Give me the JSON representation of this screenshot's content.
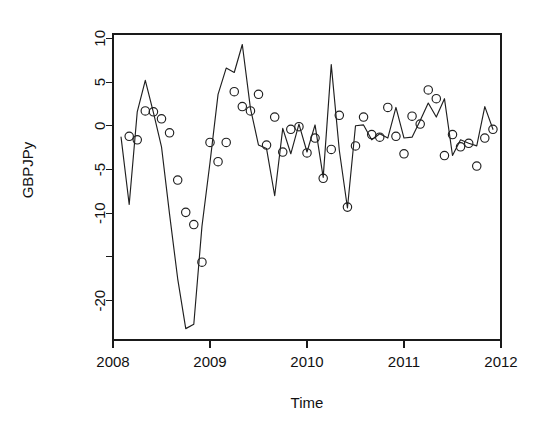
{
  "chart_data": {
    "type": "line",
    "title": "",
    "subtitle": "",
    "xlabel": "Time",
    "ylabel": "GBPJPy",
    "xlim": [
      2008.0,
      2012.0
    ],
    "ylim": [
      -24.5,
      10.5
    ],
    "grid": false,
    "legend": null,
    "x_ticks": [
      2008,
      2009,
      2010,
      2011,
      2012
    ],
    "x_tick_labels": [
      "2008",
      "2009",
      "2010",
      "2011",
      "2012"
    ],
    "y_ticks": [
      10,
      5,
      0,
      -5,
      -10,
      -15,
      -20
    ],
    "y_tick_labels": [
      "10",
      "5",
      "0",
      "-5",
      "-10",
      "",
      "-20"
    ],
    "series": [
      {
        "name": "fitted",
        "kind": "line",
        "marker": "none",
        "color": "#1f1f1f",
        "x": [
          2008.083,
          2008.167,
          2008.25,
          2008.333,
          2008.417,
          2008.5,
          2008.583,
          2008.667,
          2008.75,
          2008.833,
          2008.917,
          2009.0,
          2009.083,
          2009.167,
          2009.25,
          2009.333,
          2009.417,
          2009.5,
          2009.583,
          2009.667,
          2009.75,
          2009.833,
          2009.917,
          2010.0,
          2010.083,
          2010.167,
          2010.25,
          2010.333,
          2010.417,
          2010.5,
          2010.583,
          2010.667,
          2010.75,
          2010.833,
          2010.917,
          2011.0,
          2011.083,
          2011.167,
          2011.25,
          2011.333,
          2011.417,
          2011.5,
          2011.583,
          2011.667,
          2011.75,
          2011.833,
          2011.917
        ],
        "values": [
          -1.3,
          -9.0,
          1.6,
          5.2,
          1.5,
          -2.4,
          -10.1,
          -17.5,
          -23.2,
          -22.7,
          -11.5,
          -4.2,
          3.6,
          6.6,
          6.1,
          9.3,
          2.0,
          -2.2,
          -2.6,
          -8.0,
          -0.3,
          -3.2,
          0.2,
          -3.0,
          0.1,
          -5.9,
          7.0,
          -2.8,
          -9.4,
          0.0,
          0.1,
          -1.6,
          -0.9,
          -1.4,
          2.1,
          -1.4,
          -1.3,
          0.6,
          2.6,
          1.0,
          3.1,
          -3.4,
          -1.6,
          -2.0,
          -2.3,
          2.2,
          -0.4
        ]
      },
      {
        "name": "observed",
        "kind": "points",
        "marker": "open-circle",
        "color": "#1f1f1f",
        "x": [
          2008.167,
          2008.25,
          2008.333,
          2008.417,
          2008.5,
          2008.583,
          2008.667,
          2008.75,
          2008.833,
          2008.917,
          2009.0,
          2009.083,
          2009.167,
          2009.25,
          2009.333,
          2009.417,
          2009.5,
          2009.583,
          2009.667,
          2009.75,
          2009.833,
          2009.917,
          2010.0,
          2010.083,
          2010.167,
          2010.25,
          2010.333,
          2010.417,
          2010.5,
          2010.583,
          2010.667,
          2010.75,
          2010.833,
          2010.917,
          2011.0,
          2011.083,
          2011.167,
          2011.25,
          2011.333,
          2011.417,
          2011.5,
          2011.583,
          2011.667,
          2011.75,
          2011.833,
          2011.917
        ],
        "values": [
          -1.2,
          -1.6,
          1.7,
          1.6,
          0.8,
          -0.8,
          -6.2,
          -9.9,
          -11.3,
          -15.6,
          -1.9,
          -4.1,
          -1.9,
          3.9,
          2.2,
          1.7,
          3.6,
          -2.2,
          1.0,
          -3.0,
          -0.4,
          -0.1,
          -3.1,
          -1.4,
          -6.0,
          -2.7,
          1.2,
          -9.3,
          -2.3,
          1.0,
          -1.0,
          -1.3,
          2.1,
          -1.2,
          -3.2,
          1.1,
          0.2,
          4.1,
          3.1,
          -3.4,
          -1.0,
          -2.4,
          -2.0,
          -4.6,
          -1.4,
          -0.4
        ]
      }
    ]
  },
  "figure": {
    "plot_area": {
      "left": 113,
      "top": 34,
      "right": 501,
      "bottom": 340
    },
    "point_radius": 4.2
  }
}
